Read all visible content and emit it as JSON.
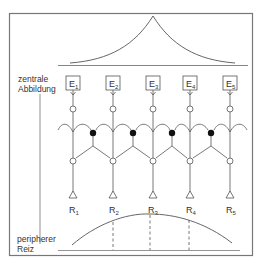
{
  "figure": {
    "central_label_line1": "zentrale",
    "central_label_line2": "Abbildung",
    "peripheral_label_line1": "peripherer",
    "peripheral_label_line2": "Reiz"
  },
  "central_units": [
    {
      "main": "E",
      "sub": "1"
    },
    {
      "main": "E",
      "sub": "2"
    },
    {
      "main": "E",
      "sub": "3"
    },
    {
      "main": "E",
      "sub": "4"
    },
    {
      "main": "E",
      "sub": "5"
    }
  ],
  "receptors": [
    {
      "main": "R",
      "sub": "1"
    },
    {
      "main": "R",
      "sub": "2"
    },
    {
      "main": "R",
      "sub": "3"
    },
    {
      "main": "R",
      "sub": "4"
    },
    {
      "main": "R",
      "sub": "5"
    }
  ],
  "colors": {
    "line": "#555555",
    "frame": "#777777",
    "inhibitory_node": "#111111"
  }
}
